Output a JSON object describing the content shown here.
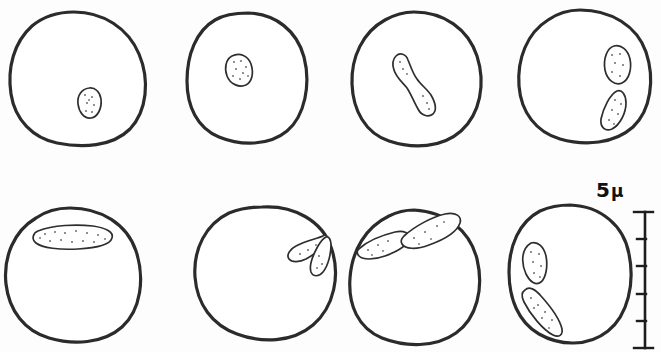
{
  "figure": {
    "background_color": "#fdfdfd",
    "ink_color": "#2b2b2b",
    "stipple_color": "#6d6d6d",
    "scale_bar": {
      "value": "5",
      "unit": "μ",
      "label": "5 μ",
      "orientation": "vertical",
      "divisions": 5,
      "top_y": 212,
      "bottom_y": 348,
      "x": 645
    },
    "rows": [
      {
        "row_index": 0,
        "cells": [
          {
            "id": "cell-1",
            "stage_label": "interphase",
            "nucleus_count": 1,
            "nucleus_shape": "small oval",
            "nucleus_position": "lower-right of centre",
            "cx": 76,
            "cy": 76,
            "rx": 66,
            "ry": 65
          },
          {
            "id": "cell-2",
            "stage_label": "interphase",
            "nucleus_count": 1,
            "nucleus_shape": "triangular fan",
            "nucleus_position": "upper-left of centre",
            "cx": 246,
            "cy": 76,
            "rx": 59,
            "ry": 65
          },
          {
            "id": "cell-3",
            "stage_label": "dividing nucleus",
            "nucleus_count": 1,
            "nucleus_shape": "dumbbell / hourglass",
            "nucleus_position": "centre, diagonal",
            "cx": 416,
            "cy": 76,
            "rx": 64,
            "ry": 65
          },
          {
            "id": "cell-4",
            "stage_label": "separated daughter nuclei",
            "nucleus_count": 2,
            "nucleus_shape": "two spindles",
            "nucleus_position": "right side, stacked",
            "cx": 584,
            "cy": 74,
            "rx": 66,
            "ry": 65
          }
        ]
      },
      {
        "row_index": 1,
        "cells": [
          {
            "id": "cell-5",
            "stage_label": "flattened nucleus",
            "nucleus_count": 1,
            "nucleus_shape": "elongated band",
            "nucleus_position": "top, horizontal",
            "cx": 72,
            "cy": 275,
            "rx": 68,
            "ry": 67
          },
          {
            "id": "cell-6",
            "stage_label": "paired teardrop nuclei",
            "nucleus_count": 2,
            "nucleus_shape": "two teardrops joined at apex",
            "nucleus_position": "upper-right",
            "cx": 265,
            "cy": 272,
            "rx": 70,
            "ry": 65
          },
          {
            "id": "cell-7",
            "stage_label": "nuclei at membrane",
            "nucleus_count": 2,
            "nucleus_shape": "two elongated spindles",
            "nucleus_position": "along the upper margin",
            "cx": 415,
            "cy": 275,
            "rx": 65,
            "ry": 67
          },
          {
            "id": "cell-8",
            "stage_label": "wedge nuclei at margin",
            "nucleus_count": 2,
            "nucleus_shape": "two wedges meeting in a V",
            "nucleus_position": "left margin",
            "cx": 569,
            "cy": 272,
            "rx": 61,
            "ry": 68
          }
        ]
      }
    ]
  }
}
